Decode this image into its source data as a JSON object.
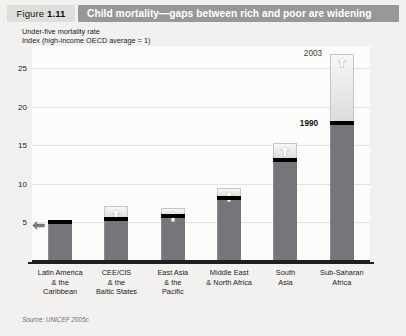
{
  "figure": {
    "label": "Figure",
    "number": "1.11",
    "title": "Child mortality—gaps between rich and poor are widening"
  },
  "subtitle": {
    "line1": "Under-five mortality rate",
    "line2": "Index (high-income OECD average = 1)"
  },
  "source": "Source: UNICEF 2005c.",
  "colors": {
    "title_band": "#98989a",
    "figure_chip": "#dededa",
    "bar_1990": "#76767a",
    "bar_band": "#000000",
    "bar_2003": "#e8e8e7",
    "page": "#f2f1ef"
  },
  "annotations": {
    "year_2003": "2003",
    "year_1990": "1990"
  },
  "chart_data": {
    "type": "bar",
    "title": "Child mortality—gaps between rich and poor are widening",
    "subtitle": "Under-five mortality rate",
    "xlabel": "",
    "ylabel": "Index (high-income OECD average = 1)",
    "ylim": [
      0,
      28
    ],
    "yticks": [
      5,
      10,
      15,
      20,
      25
    ],
    "grid": true,
    "legend_position": "none",
    "categories": [
      "Latin America & the Caribbean",
      "CEE/CIS & the Baltic States",
      "East Asia & the Pacific",
      "Middle East & North Africa",
      "South Asia",
      "Sub-Saharan Africa"
    ],
    "category_lines": [
      [
        "Latin America",
        "& the",
        "Caribbean"
      ],
      [
        "CEE/CIS",
        "& the",
        "Baltic States"
      ],
      [
        "East Asia",
        "& the",
        "Pacific"
      ],
      [
        "Middle East",
        "& North Africa"
      ],
      [
        "South",
        "Asia"
      ],
      [
        "Sub-Saharan",
        "Africa"
      ]
    ],
    "series": [
      {
        "name": "1990",
        "values": [
          5.2,
          5.6,
          6.0,
          8.3,
          13.2,
          18.0
        ]
      },
      {
        "name": "2003",
        "values": [
          5.2,
          7.2,
          7.0,
          9.6,
          15.4,
          27.0
        ]
      }
    ],
    "direction": [
      "flat",
      "up",
      "up",
      "up",
      "up",
      "up"
    ]
  }
}
